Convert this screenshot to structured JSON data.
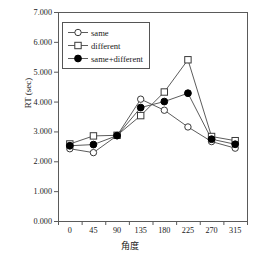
{
  "chart_data": {
    "type": "line",
    "title": "",
    "xlabel": "角度",
    "ylabel": "RT (sec)",
    "categories": [
      "0",
      "45",
      "90",
      "135",
      "180",
      "225",
      "270",
      "315"
    ],
    "x": [
      0,
      45,
      90,
      135,
      180,
      225,
      270,
      315
    ],
    "ylim": [
      0,
      7
    ],
    "ytick_labels": [
      "0.000",
      "1.000",
      "2.000",
      "3.000",
      "4.000",
      "5.000",
      "6.000",
      "7.000"
    ],
    "ytick_values": [
      0,
      1,
      2,
      3,
      4,
      5,
      6,
      7
    ],
    "grid": false,
    "legend_position": "upper-left-inside",
    "series": [
      {
        "name": "same",
        "marker": "open-circle",
        "color": "#000000",
        "values": [
          2.42,
          2.29,
          2.86,
          4.08,
          3.71,
          3.15,
          2.66,
          2.44
        ]
      },
      {
        "name": "different",
        "marker": "open-square",
        "color": "#000000",
        "values": [
          2.58,
          2.85,
          2.87,
          3.53,
          4.32,
          5.4,
          2.83,
          2.69
        ]
      },
      {
        "name": "same+different",
        "marker": "filled-circle",
        "color": "#000000",
        "values": [
          2.52,
          2.56,
          2.86,
          3.8,
          4.0,
          4.28,
          2.74,
          2.57
        ]
      }
    ]
  },
  "legend": {
    "items": [
      {
        "label": "same",
        "marker": "open-circle"
      },
      {
        "label": "different",
        "marker": "open-square"
      },
      {
        "label": "same+different",
        "marker": "filled-circle"
      }
    ]
  },
  "axes": {
    "y_title": "RT (sec)",
    "x_title": "角度"
  }
}
